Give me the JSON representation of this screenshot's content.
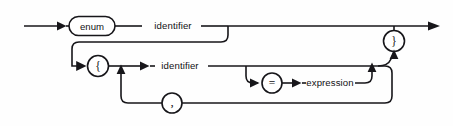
{
  "diagram": {
    "kind": "railroad-syntax-diagram",
    "canvas": {
      "width": 453,
      "height": 126,
      "background": "#fefefe"
    },
    "ink_color": "#17161a",
    "nodes": {
      "entry": {
        "name": "entry-arrow",
        "shape": "arrow",
        "label": ""
      },
      "enum_keyword": {
        "name": "enum-keyword",
        "shape": "stadium",
        "label": "enum"
      },
      "identifier_top": {
        "name": "identifier-top",
        "shape": "text",
        "label": "identifier"
      },
      "open_brace": {
        "name": "open-brace",
        "shape": "circle",
        "label": "{"
      },
      "identifier_list": {
        "name": "identifier-list",
        "shape": "text",
        "label": "identifier"
      },
      "equals": {
        "name": "equals-sign",
        "shape": "circle",
        "label": "="
      },
      "expression": {
        "name": "expression",
        "shape": "text",
        "label": "expression"
      },
      "comma": {
        "name": "comma-separator",
        "shape": "circle",
        "label": ","
      },
      "close_brace": {
        "name": "close-brace",
        "shape": "circle",
        "label": "}"
      },
      "exit": {
        "name": "exit-arrow",
        "shape": "arrow",
        "label": ""
      }
    },
    "paths": [
      "entry -> enum -> identifier -> exit",
      "identifier -> bypass down-left -> { -> identifier list",
      "identifier list -> = -> expression -> merge",
      "merge -> , -> loop back to identifier list",
      "merge -> } -> exit"
    ]
  }
}
